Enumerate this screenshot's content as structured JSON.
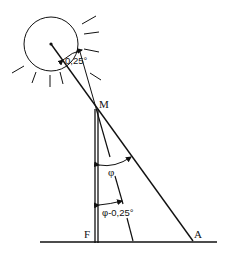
{
  "diagram": {
    "labels": {
      "top_point": "M",
      "foot_point": "F",
      "shadow_end": "A",
      "angle_main": "φ",
      "angle_reduced": "φ-0,25°",
      "sun_half_angle": "0,25°"
    },
    "elements": {
      "sun": "circle with rays",
      "pole": "vertical pole MF",
      "ground": "horizontal ground line",
      "ray_center": "line from sun center through M to A",
      "ray_edge": "line from sun edge through M, dashed below"
    }
  }
}
